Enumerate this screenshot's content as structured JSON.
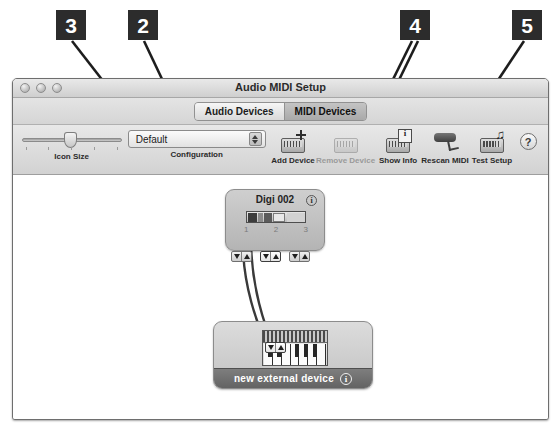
{
  "callouts": [
    {
      "number": "3",
      "name": "callout-3"
    },
    {
      "number": "2",
      "name": "callout-2"
    },
    {
      "number": "4",
      "name": "callout-4"
    },
    {
      "number": "5",
      "name": "callout-5"
    }
  ],
  "window": {
    "title": "Audio MIDI Setup",
    "controls": [
      "close",
      "minimize",
      "zoom"
    ]
  },
  "tabs": [
    {
      "label": "Audio Devices",
      "selected": false
    },
    {
      "label": "MIDI Devices",
      "selected": true
    }
  ],
  "toolbar": {
    "icon_size": {
      "label": "Icon Size",
      "value": 45
    },
    "configuration": {
      "label": "Configuration",
      "value": "Default"
    },
    "add_device": {
      "label": "Add Device",
      "icon": "rack-plus-icon",
      "enabled": true
    },
    "remove_device": {
      "label": "Remove Device",
      "icon": "rack-icon",
      "enabled": false
    },
    "show_info": {
      "label": "Show Info",
      "icon": "rack-info-icon",
      "enabled": true
    },
    "rescan_midi": {
      "label": "Rescan MIDI",
      "icon": "midi-cable-icon",
      "enabled": true
    },
    "test_setup": {
      "label": "Test Setup",
      "icon": "rack-notes-icon",
      "enabled": true
    },
    "help": {
      "label": "?",
      "icon": "help-icon"
    }
  },
  "canvas": {
    "devices": [
      {
        "name": "digi-002",
        "title": "Digi 002",
        "info_label": "i",
        "port_numbers": [
          "1",
          "2",
          "3"
        ],
        "ports": [
          {
            "in": "▼",
            "out": "▲",
            "highlighted": false
          },
          {
            "in": "▼",
            "out": "▲",
            "highlighted": true
          },
          {
            "in": "▼",
            "out": "▲",
            "highlighted": false
          }
        ]
      },
      {
        "name": "new-external-device",
        "title": "new external device",
        "info_label": "i",
        "ports": [
          {
            "in": "▼",
            "out": "▲",
            "highlighted": true
          }
        ]
      }
    ],
    "cables": 2
  }
}
